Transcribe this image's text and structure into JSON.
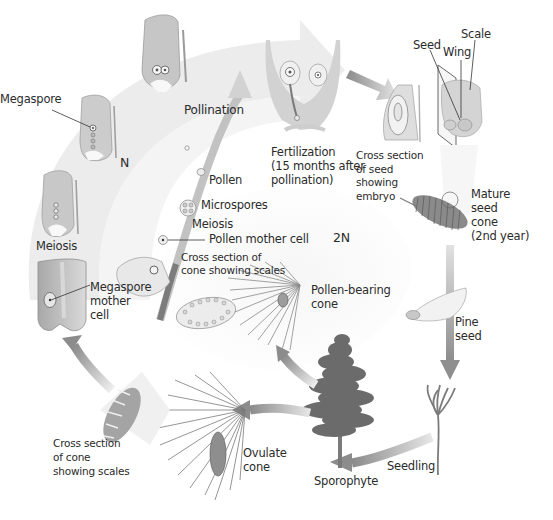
{
  "diagram": {
    "type": "life-cycle",
    "phases": {
      "haploid": "N",
      "diploid": "2N"
    },
    "labels": {
      "megaspore": "Megaspore",
      "pollination": "Pollination",
      "pollen": "Pollen",
      "microspores": "Microspores",
      "meiosis_center": "Meiosis",
      "pollen_mother_cell": "Pollen mother cell",
      "cross_section_cone_top": "Cross section of\ncone showing scales",
      "meiosis_left": "Meiosis",
      "megaspore_mother_cell": "Megaspore\nmother\ncell",
      "fertilization": "Fertilization\n(15 months after\npollination)",
      "cross_section_seed": "Cross section\nof seed\nshowing\nembryo",
      "seed": "Seed",
      "wing": "Wing",
      "scale": "Scale",
      "mature_seed_cone": "Mature\nseed\ncone\n(2nd year)",
      "pollen_bearing_cone": "Pollen-bearing\ncone",
      "pine_seed": "Pine\nseed",
      "seedling": "Seedling",
      "sporophyte": "Sporophyte",
      "ovulate_cone": "Ovulate\ncone",
      "cross_section_cone_bottom": "Cross section\nof cone\nshowing scales"
    },
    "stages": [
      "Sporophyte",
      "Pollen-bearing cone",
      "Ovulate cone",
      "Megaspore mother cell",
      "Meiosis",
      "Megaspore",
      "Pollination",
      "Fertilization",
      "Cross section of seed showing embryo",
      "Mature seed cone",
      "Pine seed",
      "Seedling"
    ],
    "colors": {
      "background": "#ffffff",
      "band_light": "#ececec",
      "band_mid": "#d6d6d6",
      "arrow_dark": "#8a8a8a",
      "tissue": "#bdbdbd",
      "text": "#2b2b2b"
    }
  }
}
